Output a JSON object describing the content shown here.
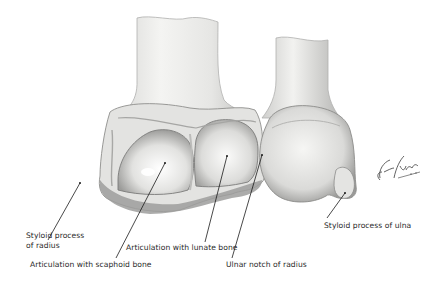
{
  "figure": {
    "signature": "F. Netter M.D.",
    "colors": {
      "background": "#ffffff",
      "bone_light": "#f2f2f0",
      "bone_mid": "#c8c8c6",
      "bone_dark": "#8a8a88",
      "label_text": "#2a2a2a",
      "leader_line": "#1a1a1a"
    }
  },
  "labels": {
    "styloid_radius": {
      "line1": "Styloid process",
      "line2": "of radius"
    },
    "scaphoid": {
      "text": "Articulation with scaphoid bone"
    },
    "lunate": {
      "text": "Articulation with lunate bone"
    },
    "ulnar_notch": {
      "text": "Ulnar notch of radius"
    },
    "styloid_ulna": {
      "text": "Styloid process of ulna"
    }
  }
}
